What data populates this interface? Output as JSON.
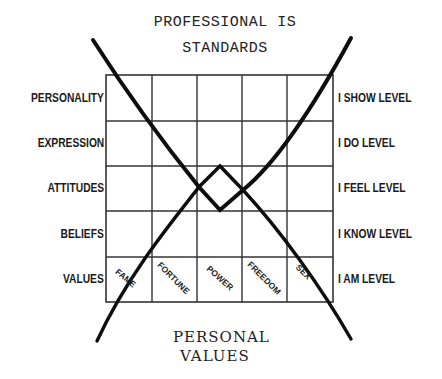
{
  "title": {
    "line1": "PROFESSIONAL IS",
    "line2": "STANDARDS"
  },
  "bottom_title": {
    "line1": "PERSONAL",
    "line2": "VALUES"
  },
  "left_labels": [
    "PERSONALITY",
    "EXPRESSION",
    "ATTITUDES",
    "BELIEFS",
    "VALUES"
  ],
  "right_labels": [
    "I SHOW LEVEL",
    "I DO LEVEL",
    "I FEEL LEVEL",
    "I KNOW LEVEL",
    "I AM LEVEL"
  ],
  "bottom_row_cells": [
    "FAME",
    "FORTUNE",
    "POWER",
    "FREEDOM",
    "SEX"
  ],
  "grid": {
    "rows": 5,
    "columns": 5,
    "line_color": "#333333"
  },
  "curves": {
    "stroke_color": "#0d0d0d",
    "description": "Two crossing curves forming an X with a diamond at the center of the grid"
  }
}
